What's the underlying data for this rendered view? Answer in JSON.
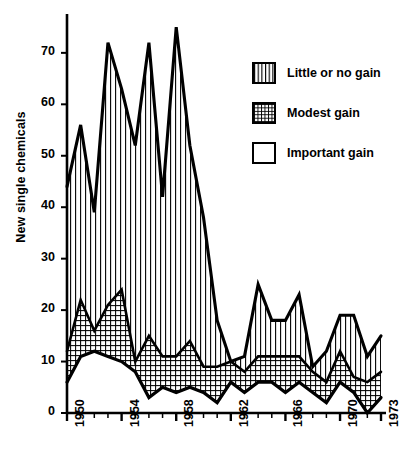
{
  "chart_data": {
    "type": "area",
    "title": "",
    "subtitle": "",
    "xlabel": "",
    "ylabel": "New single chemicals",
    "stacked": true,
    "grid": false,
    "legend_position": "top-right",
    "xlim": [
      1950,
      1973
    ],
    "ylim": [
      0,
      76
    ],
    "y_ticks": [
      0,
      10,
      20,
      30,
      40,
      50,
      60,
      70
    ],
    "x_ticks": [
      1950,
      1954,
      1958,
      1962,
      1966,
      1970,
      1973
    ],
    "x_tick_labels": [
      "1950",
      "1954",
      "1958",
      "1962",
      "1966",
      "1970",
      "1973"
    ],
    "y_tick_labels": [
      "0",
      "10",
      "20",
      "30",
      "40",
      "50",
      "60",
      "70"
    ],
    "x": [
      1950,
      1951,
      1952,
      1953,
      1954,
      1955,
      1956,
      1957,
      1958,
      1959,
      1960,
      1961,
      1962,
      1963,
      1964,
      1965,
      1966,
      1967,
      1968,
      1969,
      1970,
      1971,
      1972,
      1973
    ],
    "series": [
      {
        "name": "Important gain",
        "pattern": "blank",
        "values": [
          6,
          11,
          12,
          11,
          10,
          8,
          3,
          5,
          4,
          5,
          4,
          2,
          6,
          4,
          6,
          6,
          4,
          6,
          4,
          2,
          6,
          4,
          0,
          3
        ]
      },
      {
        "name": "Modest gain",
        "pattern": "crosshatch",
        "values": [
          6,
          11,
          4,
          10,
          14,
          2,
          12,
          6,
          7,
          9,
          5,
          7,
          4,
          4,
          5,
          5,
          7,
          5,
          4,
          4,
          6,
          3,
          6,
          5
        ]
      },
      {
        "name": "Little or no gain",
        "pattern": "vertical-lines",
        "values": [
          32,
          34,
          23,
          51,
          39,
          42,
          57,
          31,
          64,
          38,
          29,
          9,
          0,
          3,
          14,
          7,
          7,
          12,
          1,
          6,
          7,
          12,
          5,
          7
        ]
      }
    ],
    "cumulative_totals": [
      44,
      56,
      39,
      72,
      63,
      52,
      72,
      42,
      75,
      52,
      38,
      18,
      10,
      11,
      25,
      18,
      18,
      23,
      9,
      12,
      19,
      19,
      11,
      15
    ],
    "cumulative_lower": [
      6,
      11,
      12,
      11,
      10,
      8,
      3,
      5,
      4,
      5,
      4,
      2,
      6,
      4,
      6,
      6,
      4,
      6,
      4,
      2,
      6,
      4,
      0,
      3
    ],
    "cumulative_middle": [
      12,
      22,
      16,
      21,
      24,
      10,
      15,
      11,
      11,
      14,
      9,
      9,
      10,
      8,
      11,
      11,
      11,
      11,
      8,
      6,
      12,
      7,
      6,
      8
    ]
  },
  "axes": {
    "ylabel": "New single chemicals",
    "y_ticks": [
      "0",
      "10",
      "20",
      "30",
      "40",
      "50",
      "60",
      "70"
    ],
    "x_ticks": [
      "1950",
      "1954",
      "1958",
      "1962",
      "1966",
      "1970",
      "1973"
    ]
  },
  "legend": {
    "items": [
      {
        "label": "Little or no gain",
        "pattern": "vertical-lines"
      },
      {
        "label": "Modest gain",
        "pattern": "crosshatch"
      },
      {
        "label": "Important gain",
        "pattern": "blank"
      }
    ]
  },
  "colors": {
    "ink": "#000000",
    "paper": "#ffffff"
  }
}
